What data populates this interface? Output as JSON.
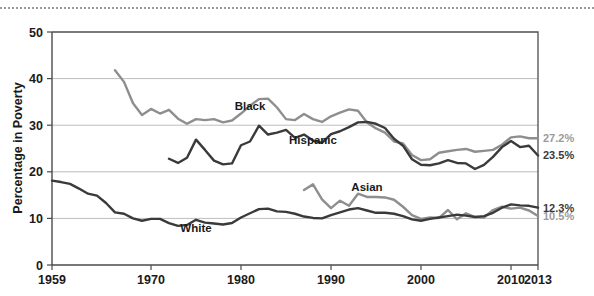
{
  "chart_data": {
    "type": "line",
    "title": "",
    "xlabel": "",
    "ylabel": "Percentage in Poverty",
    "xlim": [
      1959,
      2013
    ],
    "ylim": [
      0,
      50
    ],
    "grid": true,
    "legend": "inline-labels",
    "xticks": [
      "1959",
      "1970",
      "1980",
      "1990",
      "2000",
      "2010",
      "2013"
    ],
    "xtick_values": [
      1959,
      1970,
      1980,
      1990,
      2000,
      2010,
      2013
    ],
    "yticks": [
      "0",
      "10",
      "20",
      "30",
      "40",
      "50"
    ],
    "ytick_values": [
      0,
      10,
      20,
      30,
      40,
      50
    ],
    "series": [
      {
        "name": "Black",
        "color": "#8e8e8e",
        "label": "Black",
        "label_x": 1981,
        "label_y": 33.2,
        "end_label": "27.2%",
        "x": [
          1966,
          1967,
          1968,
          1969,
          1970,
          1971,
          1972,
          1973,
          1974,
          1975,
          1976,
          1977,
          1978,
          1979,
          1980,
          1981,
          1982,
          1983,
          1984,
          1985,
          1986,
          1987,
          1988,
          1989,
          1990,
          1991,
          1992,
          1993,
          1994,
          1995,
          1996,
          1997,
          1998,
          1999,
          2000,
          2001,
          2002,
          2003,
          2004,
          2005,
          2006,
          2007,
          2008,
          2009,
          2010,
          2011,
          2012,
          2013
        ],
        "values": [
          41.8,
          39.3,
          34.7,
          32.2,
          33.5,
          32.5,
          33.3,
          31.4,
          30.3,
          31.3,
          31.1,
          31.3,
          30.6,
          31.0,
          32.5,
          34.2,
          35.6,
          35.7,
          33.8,
          31.3,
          31.1,
          32.4,
          31.3,
          30.7,
          31.9,
          32.7,
          33.4,
          33.1,
          30.6,
          29.3,
          28.4,
          26.5,
          26.1,
          23.6,
          22.5,
          22.7,
          24.1,
          24.4,
          24.7,
          24.9,
          24.3,
          24.5,
          24.7,
          25.8,
          27.4,
          27.6,
          27.2,
          27.2
        ]
      },
      {
        "name": "Hispanic",
        "color": "#3a3a3a",
        "label": "Hispanic",
        "label_x": 1988,
        "label_y": 26.0,
        "end_label": "23.5%",
        "x": [
          1972,
          1973,
          1974,
          1975,
          1976,
          1977,
          1978,
          1979,
          1980,
          1981,
          1982,
          1983,
          1984,
          1985,
          1986,
          1987,
          1988,
          1989,
          1990,
          1991,
          1992,
          1993,
          1994,
          1995,
          1996,
          1997,
          1998,
          1999,
          2000,
          2001,
          2002,
          2003,
          2004,
          2005,
          2006,
          2007,
          2008,
          2009,
          2010,
          2011,
          2012,
          2013
        ],
        "values": [
          22.8,
          21.9,
          23.0,
          26.9,
          24.7,
          22.4,
          21.6,
          21.8,
          25.7,
          26.5,
          29.9,
          28.0,
          28.4,
          29.0,
          27.3,
          28.0,
          26.7,
          26.2,
          28.1,
          28.7,
          29.6,
          30.6,
          30.7,
          30.3,
          29.4,
          27.1,
          25.6,
          22.7,
          21.5,
          21.4,
          21.8,
          22.5,
          21.9,
          21.8,
          20.6,
          21.5,
          23.2,
          25.3,
          26.6,
          25.3,
          25.6,
          23.5
        ]
      },
      {
        "name": "Asian",
        "color": "#8e8e8e",
        "label": "Asian",
        "label_x": 1994,
        "label_y": 15.9,
        "end_label": "10.5%",
        "x": [
          1987,
          1988,
          1989,
          1990,
          1991,
          1992,
          1993,
          1994,
          1995,
          1996,
          1997,
          1998,
          1999,
          2000,
          2001,
          2002,
          2003,
          2004,
          2005,
          2006,
          2007,
          2008,
          2009,
          2010,
          2011,
          2012,
          2013
        ],
        "values": [
          16.1,
          17.3,
          14.1,
          12.2,
          13.8,
          12.7,
          15.3,
          14.6,
          14.6,
          14.5,
          14.0,
          12.5,
          10.7,
          9.9,
          10.2,
          10.1,
          11.8,
          9.8,
          11.1,
          10.3,
          10.2,
          11.8,
          12.5,
          12.1,
          12.3,
          11.7,
          10.5
        ]
      },
      {
        "name": "White",
        "color": "#3a3a3a",
        "label": "White",
        "label_x": 1975,
        "label_y": 7.1,
        "end_label": "12.3%",
        "x": [
          1959,
          1960,
          1961,
          1962,
          1963,
          1964,
          1965,
          1966,
          1967,
          1968,
          1969,
          1970,
          1971,
          1972,
          1973,
          1974,
          1975,
          1976,
          1977,
          1978,
          1979,
          1980,
          1981,
          1982,
          1983,
          1984,
          1985,
          1986,
          1987,
          1988,
          1989,
          1990,
          1991,
          1992,
          1993,
          1994,
          1995,
          1996,
          1997,
          1998,
          1999,
          2000,
          2001,
          2002,
          2003,
          2004,
          2005,
          2006,
          2007,
          2008,
          2009,
          2010,
          2011,
          2012,
          2013
        ],
        "values": [
          18.1,
          17.8,
          17.4,
          16.4,
          15.3,
          14.9,
          13.3,
          11.3,
          11.0,
          10.0,
          9.5,
          9.9,
          9.9,
          9.0,
          8.4,
          8.6,
          9.7,
          9.1,
          8.9,
          8.7,
          9.0,
          10.2,
          11.1,
          12.0,
          12.1,
          11.5,
          11.4,
          11.0,
          10.4,
          10.1,
          10.0,
          10.7,
          11.3,
          11.9,
          12.2,
          11.7,
          11.2,
          11.2,
          11.0,
          10.5,
          9.8,
          9.5,
          9.9,
          10.2,
          10.5,
          10.8,
          10.6,
          10.3,
          10.5,
          11.2,
          12.3,
          13.0,
          12.8,
          12.7,
          12.3
        ]
      }
    ]
  },
  "axes": {
    "y_title": "Percentage in Poverty"
  },
  "end_labels": [
    {
      "text": "27.2%",
      "value": 27.2,
      "style": "gray",
      "series": "Black"
    },
    {
      "text": "23.5%",
      "value": 23.5,
      "style": "dark",
      "series": "Hispanic"
    },
    {
      "text": "12.3%",
      "value": 12.3,
      "style": "dark",
      "series": "White"
    },
    {
      "text": "10.5%",
      "value": 10.5,
      "style": "gray",
      "series": "Asian"
    }
  ],
  "colors": {
    "gray_series": "#8e8e8e",
    "dark_series": "#3a3a3a",
    "gridline": "#bdbdbd",
    "axis": "#4a4a4a",
    "text": "#1a1a1a"
  }
}
